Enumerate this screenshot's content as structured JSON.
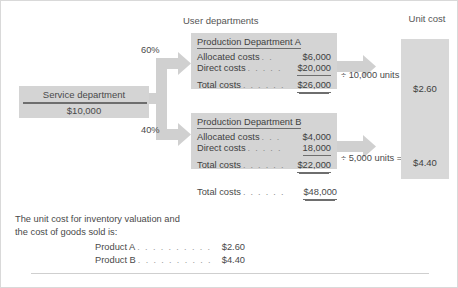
{
  "figure": {
    "headers": {
      "user_departments": "User departments",
      "unit_cost": "Unit cost"
    },
    "service_department": {
      "title": "Service department",
      "amount": "$10,000"
    },
    "allocation": {
      "pct_a": "60%",
      "pct_b": "40%"
    },
    "department_a": {
      "title": "Production Department A",
      "rows": [
        {
          "label": "Allocated costs",
          "leader": ". .",
          "value": "$6,000",
          "underline": "none"
        },
        {
          "label": "Direct costs",
          "leader": ". . . . .",
          "value": "$20,000",
          "underline": "single"
        },
        {
          "label": "Total costs",
          "leader": ". . . . . .",
          "value": "$26,000",
          "underline": "double"
        }
      ],
      "divisor": "÷ 10,000 units =",
      "unit_cost": "$2.60"
    },
    "department_b": {
      "title": "Production Department B",
      "rows": [
        {
          "label": "Allocated costs",
          "leader": ". . .",
          "value": "$4,000",
          "underline": "none"
        },
        {
          "label": "Direct costs",
          "leader": ". . . . .",
          "value": "18,000",
          "underline": "single"
        },
        {
          "label": "Total costs",
          "leader": ". . . . . .",
          "value": "$22,000",
          "underline": "double"
        }
      ],
      "divisor": "÷ 5,000 units =",
      "unit_cost": "$4.40"
    },
    "grand_total": {
      "label": "Total costs",
      "leader": ". . . . . .",
      "value": "$48,000",
      "underline": "double"
    },
    "note": {
      "line1": "The unit cost for inventory valuation and",
      "line2": "the cost of goods sold is:",
      "rows": [
        {
          "label": "Product A",
          "leader": ". . . . . . . . . .",
          "value": "$2.60"
        },
        {
          "label": "Product B",
          "leader": ". . . . . . . . . .",
          "value": "$4.40"
        }
      ]
    },
    "colors": {
      "box_fill": "#d4d4d4",
      "arrow_fill": "#d0d0d0",
      "rule": "#6e6e6e",
      "text": "#4a4a4a"
    }
  }
}
